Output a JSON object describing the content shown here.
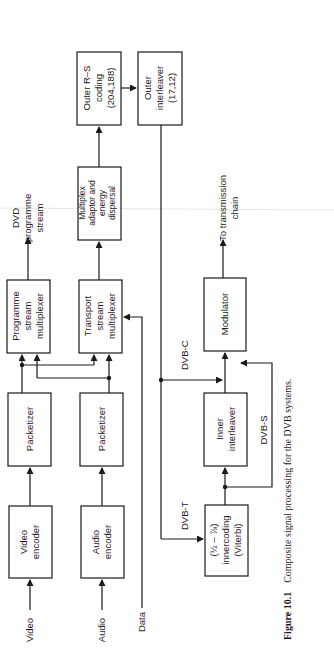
{
  "figure": {
    "caption_number": "Figure 10.1",
    "caption_text": "Composite signal processing for the DVB systems."
  },
  "inputs": {
    "video": "Video",
    "audio": "Audio",
    "data": "Data"
  },
  "blocks": {
    "video_encoder": [
      "Video",
      "encoder"
    ],
    "audio_encoder": [
      "Audio",
      "encoder"
    ],
    "packetizer_video": [
      "Packetizer"
    ],
    "packetizer_audio": [
      "Packetizer"
    ],
    "programme_mux": [
      "Programme",
      "stream",
      "multiplexer"
    ],
    "transport_mux": [
      "Transport",
      "stream",
      "multiplexer"
    ],
    "mux_adaptor": [
      "Multiplex",
      "adaptor and",
      "energy",
      "dispersal"
    ],
    "outer_rs": [
      "Outer R–S",
      "coding",
      "(204,188)"
    ],
    "outer_interleaver": [
      "Outer",
      "interleaver",
      "(17,12)"
    ],
    "inner_coding": [
      "(½ – ⅞)",
      "innercoding",
      "(Viterbi)"
    ],
    "inner_interleaver": [
      "Inner",
      "interleaver"
    ],
    "modulator": [
      "Modulator"
    ]
  },
  "outputs": {
    "dvd": [
      "DVD",
      "programme",
      "stream"
    ],
    "transmission": [
      "To transmission",
      "chain"
    ]
  },
  "paths": {
    "dvb_c": "DVB-C",
    "dvb_t": "DVB-T",
    "dvb_s": "DVB-S"
  }
}
